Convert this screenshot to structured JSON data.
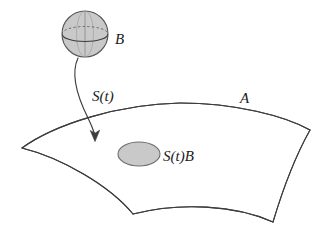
{
  "figure": {
    "background_color": "#ffffff",
    "stroke_color": "#3d3d3d",
    "fill_gray": "#c9c9c9",
    "labels": {
      "ball": "B",
      "operator": "S(t)",
      "image_set": "S(t)B",
      "attractor": "A"
    },
    "elements": {
      "ball_name": "shaded sphere representing bounded set B",
      "arrow_name": "curved arrow labeled S(t)",
      "surface_name": "curved manifold patch labeled A",
      "image_ellipse_name": "shaded ellipse representing S(t)B"
    },
    "geometry": {
      "sphere": {
        "cx": 85,
        "cy": 34,
        "r": 23
      },
      "image_ellipse": {
        "cx": 139,
        "cy": 154,
        "rx": 21,
        "ry": 12
      },
      "arrow_tip": {
        "x": 95,
        "y": 141
      },
      "surface_corners": {
        "left": {
          "x": 22,
          "y": 148
        },
        "top_right": {
          "x": 310,
          "y": 130
        },
        "bottom_left": {
          "x": 133,
          "y": 214
        },
        "bottom_right": {
          "x": 273,
          "y": 222
        }
      }
    },
    "label_positions": {
      "ball": {
        "x": 115,
        "y": 44
      },
      "operator": {
        "x": 92,
        "y": 101
      },
      "image_set": {
        "x": 163,
        "y": 161
      },
      "attractor": {
        "x": 240,
        "y": 103
      }
    }
  }
}
